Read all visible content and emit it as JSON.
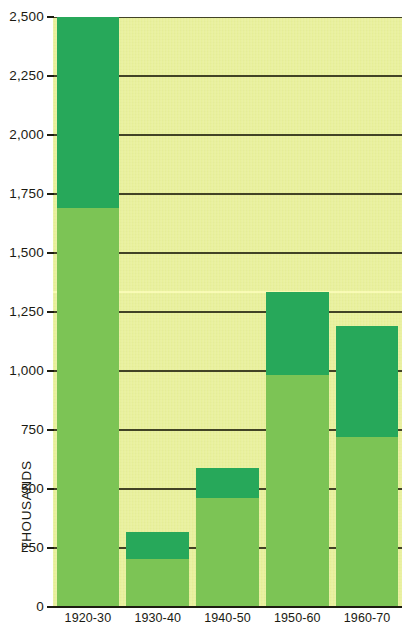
{
  "chart_data": {
    "type": "bar",
    "title": "",
    "subtitle": "",
    "xlabel": "",
    "ylabel": "THOUSANDS",
    "categories": [
      "1920-30",
      "1930-40",
      "1940-50",
      "1950-60",
      "1960-70"
    ],
    "ylim": [
      0,
      2500
    ],
    "ytick_labels": [
      "0",
      "250",
      "500",
      "750",
      "1,000",
      "1,250",
      "1,500",
      "1,750",
      "2,000",
      "2,250",
      "2,500"
    ],
    "ytick_values": [
      0,
      250,
      500,
      750,
      1000,
      1250,
      1500,
      1750,
      2000,
      2250,
      2500
    ],
    "grid": true,
    "grid_orientation": "horizontal",
    "legend": "none",
    "stacked": true,
    "series": [
      {
        "name": "lower-segment",
        "color": "#7cc455",
        "values": [
          1690,
          205,
          460,
          985,
          720
        ]
      },
      {
        "name": "upper-segment",
        "color": "#27a85a",
        "values": [
          810,
          115,
          130,
          350,
          470
        ]
      }
    ],
    "totals": [
      2500,
      320,
      590,
      1335,
      1190
    ],
    "segment_boundaries": [
      1690,
      205,
      460,
      985,
      720
    ],
    "colors": {
      "plot_background": "#e8f09a",
      "bar_light": "#7cc455",
      "bar_dark": "#27a85a",
      "gridline": "#2a2a14",
      "axis": "#1c1c10",
      "text": "#1a1a12",
      "page_background": "#ffffff"
    }
  }
}
